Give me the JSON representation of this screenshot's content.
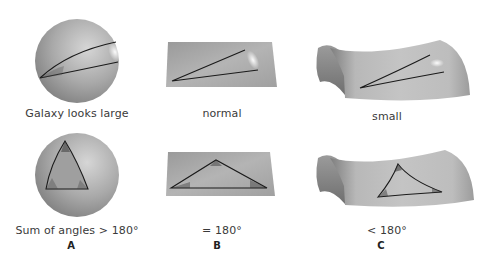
{
  "columns": [
    {
      "id": "A",
      "geometry": "sphere",
      "top_label": "Galaxy looks large",
      "bottom_label": "Sum of angles > 180°",
      "letter": "A"
    },
    {
      "id": "B",
      "geometry": "flat-plane",
      "top_label": "normal",
      "bottom_label": "= 180°",
      "letter": "B"
    },
    {
      "id": "C",
      "geometry": "saddle",
      "top_label": "small",
      "bottom_label": "< 180°",
      "letter": "C"
    }
  ],
  "colors": {
    "surface_light": "#c8c8c8",
    "surface_dark": "#8a8a8a",
    "line": "#1a1a1a",
    "background": "#ffffff"
  }
}
